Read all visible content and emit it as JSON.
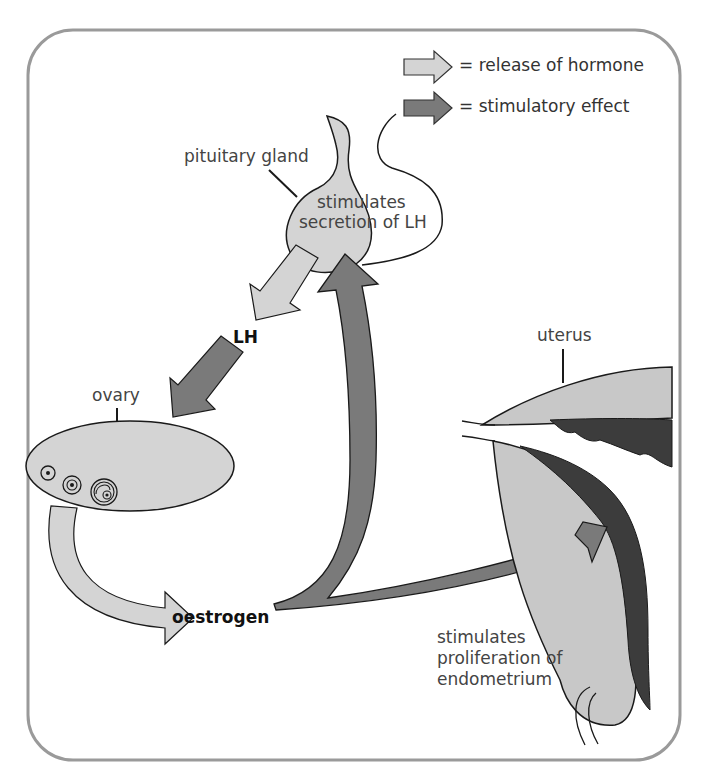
{
  "legend": {
    "items": [
      {
        "icon": "light-arrow-icon",
        "label": "= release of hormone",
        "color": "#d4d4d4"
      },
      {
        "icon": "dark-arrow-icon",
        "label": "= stimulatory effect",
        "color": "#7a7a7a"
      }
    ]
  },
  "labels": {
    "pituitary": "pituitary gland",
    "pituitary_action_line1": "stimulates",
    "pituitary_action_line2": "secretion of LH",
    "lh": "LH",
    "ovary": "ovary",
    "oestrogen": "oestrogen",
    "uterus": "uterus",
    "uterus_action_line1": "stimulates",
    "uterus_action_line2": "proliferation of",
    "uterus_action_line3": "endometrium"
  },
  "colors": {
    "frame": "#9a9a9a",
    "light_fill": "#d4d4d4",
    "dark_fill": "#7a7a7a",
    "endometrium": "#3c3c3c",
    "outline": "#1a1a1a"
  }
}
